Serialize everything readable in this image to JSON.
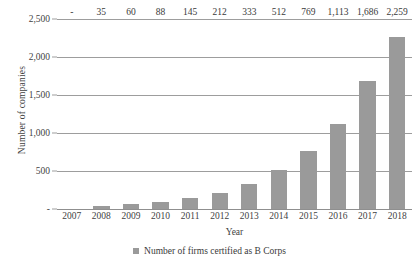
{
  "chart_data": {
    "type": "bar",
    "title": "",
    "xlabel": "Year",
    "ylabel": "Number of companies",
    "categories": [
      "2007",
      "2008",
      "2009",
      "2010",
      "2011",
      "2012",
      "2013",
      "2014",
      "2015",
      "2016",
      "2017",
      "2018"
    ],
    "values": [
      0,
      35,
      60,
      88,
      145,
      212,
      333,
      512,
      769,
      1113,
      1686,
      2259
    ],
    "point_labels": [
      "-",
      "35",
      "60",
      "88",
      "145",
      "212",
      "333",
      "512",
      "769",
      "1,113",
      "1,686",
      "2,259"
    ],
    "ylim": [
      0,
      2500
    ],
    "yticks": [
      0,
      500,
      1000,
      1500,
      2000,
      2500
    ],
    "ytick_labels": [
      "-",
      "500",
      "1,000",
      "1,500",
      "2,000",
      "2,500"
    ],
    "grid": true,
    "legend_position": "bottom",
    "series": [
      {
        "name": "Number of firms certified as B Corps",
        "color": "#9a9a9a",
        "values": [
          0,
          35,
          60,
          88,
          145,
          212,
          333,
          512,
          769,
          1113,
          1686,
          2259
        ]
      }
    ]
  },
  "legend": {
    "label": "Number of firms certified as B Corps"
  },
  "colors": {
    "bar": "#9a9a9a",
    "gridline": "#9d9d9d",
    "text": "#3a3a3a",
    "background": "#ffffff"
  }
}
